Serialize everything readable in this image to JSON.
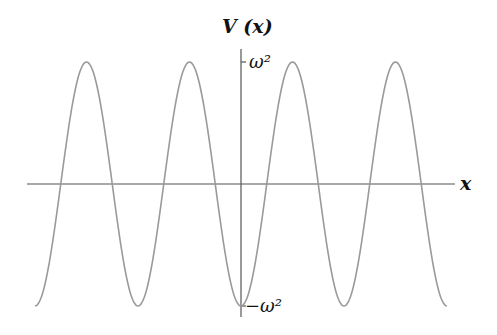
{
  "figure": {
    "y_axis_label": "V (x)",
    "x_axis_label": "x",
    "tick_top_label": "ω²",
    "tick_bottom_label": "−ω²",
    "curve_color": "#9a9a9a",
    "axis_color": "#555555"
  },
  "chart_data": {
    "type": "line",
    "title": "",
    "function": "V(x) = -ω² cos(kx)",
    "xlabel": "x",
    "ylabel": "V (x)",
    "y_ticks": [
      "-ω²",
      "ω²"
    ],
    "ylim": [
      -1,
      1
    ],
    "x_range_periods": [
      -2,
      2
    ],
    "extrema": {
      "minima_x_periods": [
        -2,
        -1,
        0,
        1,
        2
      ],
      "maxima_x_periods": [
        -1.5,
        -0.5,
        0.5,
        1.5
      ]
    },
    "grid": false,
    "legend": false,
    "layout": {
      "origin_px": [
        241,
        184
      ],
      "period_px": 103,
      "amplitude_px": 122,
      "x_axis_px": [
        27,
        455
      ],
      "y_axis_px": [
        49,
        317
      ]
    }
  }
}
